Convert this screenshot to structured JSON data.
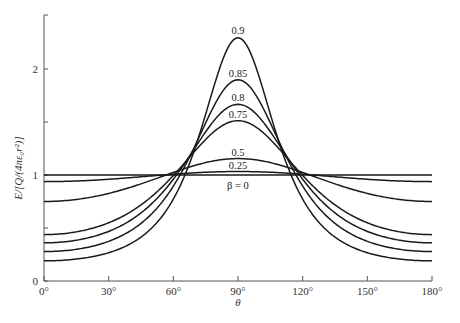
{
  "chart_data": {
    "type": "line",
    "title": "",
    "xlabel": "θ",
    "ylabel": "E/[Q/(4πε₀r²)]",
    "xlim": [
      0,
      180
    ],
    "ylim": [
      0,
      2.5
    ],
    "grid": false,
    "legend": "inline curve labels near peaks",
    "x_ticks": [
      0,
      30,
      60,
      90,
      120,
      150,
      180
    ],
    "x_tick_labels": [
      "0°",
      "30°",
      "60°",
      "90°",
      "120°",
      "150°",
      "180°"
    ],
    "y_ticks": [
      0,
      0.5,
      1,
      1.5,
      2
    ],
    "y_tick_labels": [
      "0",
      "",
      "1",
      "",
      "2"
    ],
    "formula": "(1-β²)/(1-β²sin²θ)^(3/2)",
    "x": [
      0,
      30,
      60,
      90,
      120,
      150,
      180
    ],
    "series": [
      {
        "name": "β = 0",
        "beta": 0,
        "label": "β = 0",
        "values": [
          1.0,
          1.0,
          1.0,
          1.0,
          1.0,
          1.0,
          1.0
        ]
      },
      {
        "name": "0.25",
        "beta": 0.25,
        "label": "0.25",
        "values": [
          0.938,
          0.96,
          1.008,
          1.033,
          1.008,
          0.96,
          0.938
        ]
      },
      {
        "name": "0.5",
        "beta": 0.5,
        "label": "0.5",
        "values": [
          0.75,
          0.826,
          1.024,
          1.155,
          1.024,
          0.826,
          0.75
        ]
      },
      {
        "name": "0.75",
        "beta": 0.75,
        "label": "0.75",
        "values": [
          0.438,
          0.549,
          0.995,
          1.512,
          0.995,
          0.549,
          0.438
        ]
      },
      {
        "name": "0.8",
        "beta": 0.8,
        "label": "0.8",
        "values": [
          0.36,
          0.468,
          0.96,
          1.667,
          0.96,
          0.468,
          0.36
        ]
      },
      {
        "name": "0.85",
        "beta": 0.85,
        "label": "0.85",
        "values": [
          0.278,
          0.374,
          0.895,
          1.898,
          0.895,
          0.374,
          0.278
        ]
      },
      {
        "name": "0.9",
        "beta": 0.9,
        "label": "0.9",
        "values": [
          0.19,
          0.267,
          0.773,
          2.294,
          0.773,
          0.267,
          0.19
        ]
      }
    ]
  }
}
